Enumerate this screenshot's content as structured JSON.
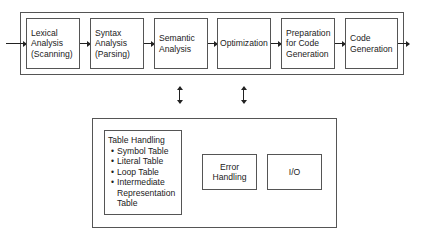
{
  "pipeline": {
    "phases": [
      {
        "lines": [
          "Lexical",
          "Analysis",
          "(Scanning)"
        ]
      },
      {
        "lines": [
          "Syntax",
          "Analysis",
          "(Parsing)"
        ]
      },
      {
        "lines": [
          "Semantic",
          "Analysis"
        ]
      },
      {
        "lines": [
          "Optimization"
        ]
      },
      {
        "lines": [
          "Preparation",
          "for Code",
          "Generation"
        ]
      },
      {
        "lines": [
          "Code",
          "Generation"
        ]
      }
    ]
  },
  "support": {
    "table_handling": {
      "title": "Table Handling",
      "items": [
        {
          "bullet": "•",
          "lines": [
            "Symbol Table"
          ]
        },
        {
          "bullet": "•",
          "lines": [
            "Literal Table"
          ]
        },
        {
          "bullet": "•",
          "lines": [
            "Loop Table"
          ]
        },
        {
          "bullet": "•",
          "lines": [
            "Intermediate",
            "Representation",
            "Table"
          ]
        }
      ]
    },
    "error_handling": {
      "lines": [
        "Error",
        "Handling"
      ]
    },
    "io": {
      "lines": [
        "I/O"
      ]
    }
  },
  "colors": {
    "line": "#222222",
    "border": "#555555",
    "background": "#ffffff"
  }
}
